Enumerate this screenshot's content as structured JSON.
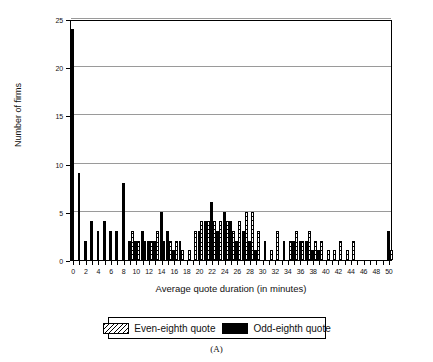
{
  "figure": {
    "panel_label": "(A)"
  },
  "legend": {
    "position": "bottom-center",
    "entries": [
      {
        "label": "Even-eighth quote",
        "style": "hatched",
        "color": "#ffffff"
      },
      {
        "label": "Odd-eighth quote",
        "style": "solid",
        "color": "#000000"
      }
    ]
  },
  "chart_data": {
    "type": "bar",
    "title": "",
    "subtitle": "",
    "xlabel": "Average quote duration (in minutes)",
    "ylabel": "Number of firms",
    "xlim": [
      -0.5,
      50.5
    ],
    "ylim": [
      0,
      25
    ],
    "grid": true,
    "x_ticks": [
      0,
      1,
      2,
      3,
      4,
      5,
      6,
      7,
      8,
      9,
      10,
      11,
      12,
      13,
      14,
      15,
      16,
      17,
      18,
      19,
      20,
      21,
      22,
      23,
      24,
      25,
      26,
      27,
      28,
      29,
      30,
      31,
      32,
      33,
      34,
      35,
      36,
      37,
      38,
      39,
      40,
      41,
      42,
      43,
      44,
      45,
      46,
      47,
      48,
      49,
      50
    ],
    "x_tick_labels": [
      "0",
      "",
      "2",
      "",
      "4",
      "",
      "6",
      "",
      "8",
      "",
      "10",
      "",
      "12",
      "",
      "14",
      "",
      "16",
      "",
      "18",
      "",
      "20",
      "",
      "22",
      "",
      "24",
      "",
      "26",
      "",
      "28",
      "",
      "30",
      "",
      "32",
      "",
      "34",
      "",
      "36",
      "",
      "38",
      "",
      "40",
      "",
      "42",
      "",
      "44",
      "",
      "46",
      "",
      "48",
      "",
      "50"
    ],
    "y_ticks": [
      0,
      5,
      10,
      15,
      20,
      25
    ],
    "y_tick_labels": [
      "0",
      "5",
      "10",
      "15",
      "20",
      "25"
    ],
    "categories": [
      0,
      1,
      2,
      3,
      4,
      5,
      6,
      7,
      8,
      9,
      10,
      11,
      12,
      13,
      14,
      15,
      16,
      17,
      18,
      19,
      20,
      21,
      22,
      23,
      24,
      25,
      26,
      27,
      28,
      29,
      30,
      31,
      32,
      33,
      34,
      35,
      36,
      37,
      38,
      39,
      40,
      41,
      42,
      43,
      44,
      45,
      46,
      47,
      48,
      49,
      50
    ],
    "series": [
      {
        "name": "Odd-eighth quote",
        "style": "solid",
        "color": "#000000",
        "values": [
          24,
          9,
          2,
          4,
          3,
          4,
          3,
          3,
          8,
          2,
          2,
          3,
          2,
          2,
          5,
          3,
          1,
          2,
          0,
          0,
          3,
          4,
          6,
          3,
          5,
          4,
          2,
          3,
          2,
          1,
          0,
          0,
          0,
          0,
          0,
          2,
          2,
          2,
          1,
          1,
          0,
          0,
          0,
          0,
          0,
          0,
          0,
          0,
          0,
          0,
          3
        ]
      },
      {
        "name": "Even-eighth quote",
        "style": "hatched",
        "color": "#ffffff",
        "values": [
          0,
          0,
          0,
          0,
          0,
          0,
          0,
          0,
          0,
          3,
          2,
          2,
          2,
          3,
          2,
          2,
          2,
          1,
          1,
          3,
          4,
          4,
          4,
          4,
          4,
          3,
          4,
          5,
          5,
          3,
          2,
          1,
          3,
          2,
          2,
          3,
          2,
          3,
          2,
          2,
          1,
          1,
          2,
          1,
          2,
          0,
          0,
          0,
          0,
          0,
          1
        ]
      }
    ]
  }
}
